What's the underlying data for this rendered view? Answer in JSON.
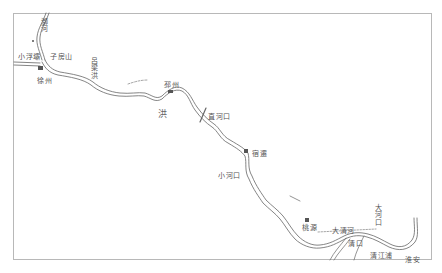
{
  "map": {
    "title": "",
    "style": "hand-drawn river map",
    "colors": {
      "line": "#666666",
      "text": "#555555",
      "frame": "#b8b8b8",
      "background": "#ffffff"
    },
    "labels": [
      {
        "id": "xu-he",
        "text": "溮河",
        "orientation": "vertical",
        "x": 42,
        "y": 21
      },
      {
        "id": "xiao-fu-ba",
        "text": "小浮壩",
        "orientation": "horizontal",
        "x": 18,
        "y": 54
      },
      {
        "id": "zi-fang-shan",
        "text": "子房山",
        "orientation": "horizontal",
        "x": 50,
        "y": 54
      },
      {
        "id": "xuzhou",
        "text": "徐州",
        "orientation": "horizontal",
        "x": 37,
        "y": 78
      },
      {
        "id": "lu-liang-hong",
        "text": "呂梁洪",
        "orientation": "vertical",
        "x": 92,
        "y": 60
      },
      {
        "id": "pizhou",
        "text": "邳州",
        "orientation": "horizontal",
        "x": 164,
        "y": 82
      },
      {
        "id": "hong",
        "text": "洪",
        "orientation": "horizontal",
        "x": 158,
        "y": 110
      },
      {
        "id": "zhi-he-kou",
        "text": "直河口",
        "orientation": "horizontal",
        "x": 208,
        "y": 114
      },
      {
        "id": "su-qian",
        "text": "宿遷",
        "orientation": "horizontal",
        "x": 252,
        "y": 151
      },
      {
        "id": "xiao-he-kou",
        "text": "小河口",
        "orientation": "horizontal",
        "x": 218,
        "y": 173
      },
      {
        "id": "tao-yuan",
        "text": "桃源",
        "orientation": "horizontal",
        "x": 302,
        "y": 225
      },
      {
        "id": "da-qing-he",
        "text": "大清河",
        "orientation": "horizontal",
        "x": 332,
        "y": 228
      },
      {
        "id": "da-he-kou",
        "text": "大河口",
        "orientation": "vertical",
        "x": 376,
        "y": 207
      },
      {
        "id": "qing-kou",
        "text": "清口",
        "orientation": "horizontal",
        "x": 348,
        "y": 241
      },
      {
        "id": "huai-an",
        "text": "淮安",
        "orientation": "horizontal",
        "x": 405,
        "y": 257
      },
      {
        "id": "qing-jiang-pu",
        "text": "清江浦",
        "orientation": "horizontal",
        "x": 370,
        "y": 253
      }
    ],
    "marks": [
      {
        "id": "mark-xuzhou",
        "x": 40,
        "y": 67
      },
      {
        "id": "mark-pizhou",
        "x": 171,
        "y": 92
      },
      {
        "id": "mark-suqian",
        "x": 246,
        "y": 151
      },
      {
        "id": "mark-taoyuan",
        "x": 307,
        "y": 219
      }
    ]
  }
}
